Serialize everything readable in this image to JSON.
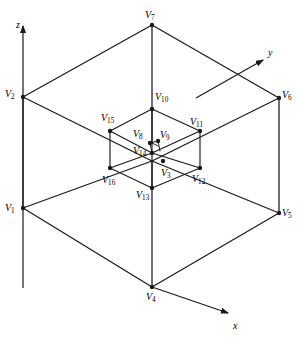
{
  "figure": {
    "stroke_color": "#1a1a1a",
    "background_color": "#ffffff"
  },
  "axes": [
    {
      "name": "z",
      "label": "z",
      "label_x": 16,
      "label_y": 20,
      "from": [
        23,
        288
      ],
      "to": [
        23,
        26
      ]
    },
    {
      "name": "y",
      "label": "y",
      "label_x": 268,
      "label_y": 48,
      "from": [
        196,
        98
      ],
      "to": [
        263,
        60
      ]
    },
    {
      "name": "x",
      "label": "x",
      "label_x": 233,
      "label_y": 321,
      "from": [
        152,
        287
      ],
      "to": [
        228,
        313
      ]
    }
  ],
  "vertices": [
    {
      "id": "V1",
      "label": "V",
      "sub": "1",
      "x": 23,
      "y": 208,
      "label_x": 5,
      "label_y": 203
    },
    {
      "id": "V2",
      "label": "V",
      "sub": "2",
      "x": 23,
      "y": 97,
      "label_x": 5,
      "label_y": 89
    },
    {
      "id": "V3",
      "label": "V",
      "sub": "3",
      "x": 163,
      "y": 161,
      "label_x": 161,
      "label_y": 168
    },
    {
      "id": "V4",
      "label": "V",
      "sub": "4",
      "x": 152,
      "y": 287,
      "label_x": 146,
      "label_y": 292
    },
    {
      "id": "V5",
      "label": "V",
      "sub": "5",
      "x": 279,
      "y": 213,
      "label_x": 282,
      "label_y": 208
    },
    {
      "id": "V6",
      "label": "V",
      "sub": "6",
      "x": 279,
      "y": 98,
      "label_x": 282,
      "label_y": 90
    },
    {
      "id": "V7",
      "label": "V",
      "sub": "7",
      "x": 152,
      "y": 25,
      "label_x": 145,
      "label_y": 10
    },
    {
      "id": "V8",
      "label": "V",
      "sub": "8",
      "x": 150,
      "y": 143,
      "label_x": 133,
      "label_y": 129
    },
    {
      "id": "V9",
      "label": "V",
      "sub": "9",
      "x": 158,
      "y": 141,
      "label_x": 160,
      "label_y": 130
    },
    {
      "id": "V10",
      "label": "V",
      "sub": "10",
      "x": 152,
      "y": 109,
      "label_x": 155,
      "label_y": 92
    },
    {
      "id": "V11",
      "label": "V",
      "sub": "11",
      "x": 200,
      "y": 131,
      "label_x": 190,
      "label_y": 117
    },
    {
      "id": "V12",
      "label": "V",
      "sub": "12",
      "x": 200,
      "y": 168,
      "label_x": 192,
      "label_y": 174
    },
    {
      "id": "V13",
      "label": "V",
      "sub": "13",
      "x": 152,
      "y": 188,
      "label_x": 136,
      "label_y": 190
    },
    {
      "id": "V14",
      "label": "V",
      "sub": "14",
      "x": 152,
      "y": 153,
      "label_x": 133,
      "label_y": 146
    },
    {
      "id": "V15",
      "label": "V",
      "sub": "15",
      "x": 110,
      "y": 131,
      "label_x": 101,
      "label_y": 113
    },
    {
      "id": "V16",
      "label": "V",
      "sub": "16",
      "x": 110,
      "y": 168,
      "label_x": 102,
      "label_y": 175
    }
  ],
  "edges": {
    "outer_cube": [
      [
        23,
        97,
        152,
        25
      ],
      [
        152,
        25,
        279,
        98
      ],
      [
        23,
        97,
        23,
        208
      ],
      [
        279,
        98,
        279,
        213
      ],
      [
        152,
        25,
        152,
        143
      ],
      [
        23,
        208,
        152,
        287
      ],
      [
        152,
        287,
        279,
        213
      ],
      [
        23,
        97,
        152,
        161
      ],
      [
        279,
        98,
        152,
        161
      ],
      [
        23,
        208,
        152,
        161
      ],
      [
        279,
        213,
        152,
        161
      ],
      [
        152,
        287,
        152,
        161
      ]
    ],
    "middle_cube": [
      [
        110,
        131,
        152,
        109
      ],
      [
        152,
        109,
        200,
        131
      ],
      [
        110,
        131,
        110,
        168
      ],
      [
        200,
        131,
        200,
        168
      ],
      [
        152,
        109,
        152,
        153
      ],
      [
        110,
        168,
        152,
        188
      ],
      [
        152,
        188,
        200,
        168
      ],
      [
        110,
        131,
        152,
        153
      ],
      [
        200,
        131,
        152,
        153
      ],
      [
        110,
        168,
        152,
        153
      ],
      [
        200,
        168,
        152,
        153
      ],
      [
        152,
        188,
        152,
        153
      ]
    ],
    "inner_cube": [
      [
        150,
        143,
        158,
        141
      ],
      [
        152,
        143,
        158,
        146
      ],
      [
        150,
        143,
        152,
        153
      ],
      [
        158,
        141,
        160,
        151
      ]
    ]
  }
}
